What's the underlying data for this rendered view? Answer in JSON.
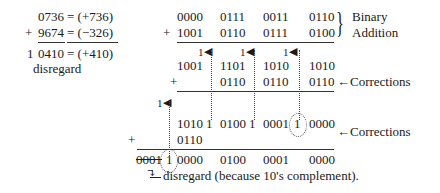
{
  "decimal": {
    "operand1": "0736",
    "operand1_value": "= (+736)",
    "plus": "+",
    "operand2": "9674",
    "operand2_value": "= (−326)",
    "carry_digit": "1",
    "result": "0410",
    "result_value": "= (+410)",
    "disregard_label": "disregard"
  },
  "binary": {
    "row1": [
      "0000",
      "0111",
      "0011",
      "0110"
    ],
    "plus": "+",
    "row2": [
      "1001",
      "0110",
      "0111",
      "0100"
    ],
    "brace_label_1": "Binary",
    "brace_label_2": "Addition",
    "sum": [
      "1001",
      "1101",
      "1010",
      "1010"
    ],
    "corrections1": [
      "",
      "0110",
      "0110",
      "0110"
    ],
    "corrections_label_1": "←Corrections",
    "carry_marks": [
      "1",
      "1",
      "1",
      "1"
    ],
    "sum2": [
      "1010",
      "1",
      "0100",
      "1",
      "0001",
      "1",
      "0000"
    ],
    "corrections2": [
      "0110"
    ],
    "corrections_label_2": "←Corrections",
    "final": [
      "0001",
      "1",
      "0000",
      "0100",
      "0001",
      "0000"
    ],
    "final_note": "disregard (because 10's complement)."
  }
}
